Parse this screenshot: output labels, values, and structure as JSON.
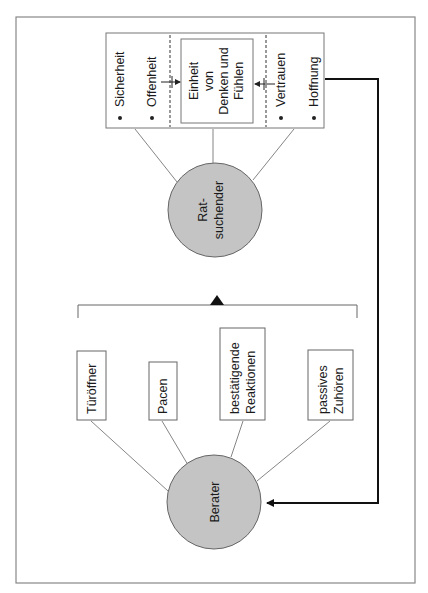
{
  "diagram": {
    "client": {
      "label_lines": [
        "Rat-",
        "suchender"
      ],
      "fill": "#c4c4c4",
      "qualities_left": [
        "Sicherheit",
        "Offenheit"
      ],
      "center_lines": [
        "Einheit",
        "von",
        "Denken und",
        "Fühlen"
      ],
      "qualities_right": [
        "Vertrauen",
        "Hoffnung"
      ]
    },
    "counselor": {
      "label": "Berater",
      "fill": "#c4c4c4",
      "techniques": [
        {
          "lines": [
            "Türöffner"
          ]
        },
        {
          "lines": [
            "Pacen"
          ]
        },
        {
          "lines": [
            "bestätigende",
            "Reaktionen"
          ]
        },
        {
          "lines": [
            "passives",
            "Zuhören"
          ]
        }
      ]
    },
    "colors": {
      "line": "#555555",
      "feedback": "#111111",
      "frame": "#888888"
    }
  }
}
